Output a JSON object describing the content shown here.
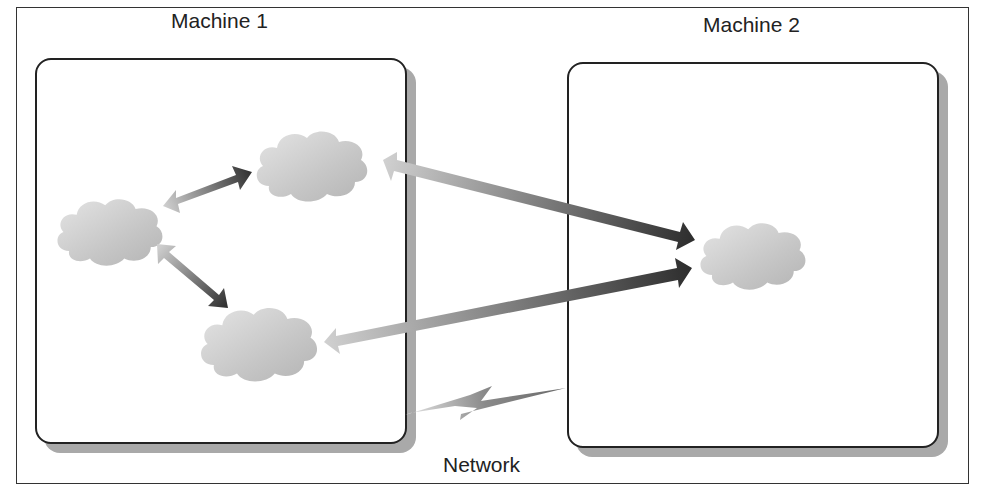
{
  "diagram": {
    "machines": [
      {
        "id": "machine-1",
        "label": "Machine 1",
        "process_count": 3
      },
      {
        "id": "machine-2",
        "label": "Machine 2",
        "process_count": 1
      }
    ],
    "network": {
      "label": "Network",
      "icon": "lightning-bolt-icon"
    },
    "nodes": [
      {
        "id": "m1-left",
        "machine": "Machine 1",
        "shape": "cloud"
      },
      {
        "id": "m1-top",
        "machine": "Machine 1",
        "shape": "cloud"
      },
      {
        "id": "m1-bottom",
        "machine": "Machine 1",
        "shape": "cloud"
      },
      {
        "id": "m2-center",
        "machine": "Machine 2",
        "shape": "cloud"
      }
    ],
    "edges": [
      {
        "from": "m1-left",
        "to": "m1-top",
        "direction": "bidirectional"
      },
      {
        "from": "m1-left",
        "to": "m1-bottom",
        "direction": "bidirectional"
      },
      {
        "from": "m1-top",
        "to": "m2-center",
        "direction": "bidirectional"
      },
      {
        "from": "m1-bottom",
        "to": "m2-center",
        "direction": "bidirectional"
      }
    ],
    "colors": {
      "arrow_light": "#c8c8c8",
      "arrow_dark": "#3a3a3a",
      "cloud": "#c4c4c4",
      "shadow": "#a9a9a9",
      "border": "#222222"
    }
  }
}
